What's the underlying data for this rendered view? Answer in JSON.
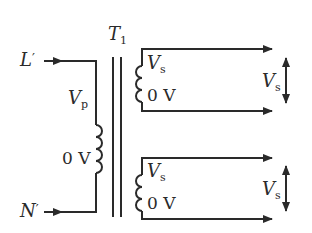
{
  "diagram": {
    "type": "transformer-schematic",
    "transformer": {
      "label": "T",
      "label_sub": "1"
    },
    "primary": {
      "live_input": {
        "label": "L",
        "mark": "′"
      },
      "neutral_input": {
        "label": "N",
        "mark": "′"
      },
      "top_tap": {
        "label": "V",
        "sub": "p"
      },
      "bottom_tap": {
        "label": "0 V"
      }
    },
    "secondaries": [
      {
        "top_tap": {
          "label": "V",
          "sub": "s"
        },
        "bottom_tap": {
          "label": "0 V"
        },
        "output_voltage": {
          "label": "V",
          "sub": "s"
        }
      },
      {
        "top_tap": {
          "label": "V",
          "sub": "s"
        },
        "bottom_tap": {
          "label": "0 V"
        },
        "output_voltage": {
          "label": "V",
          "sub": "s"
        }
      }
    ],
    "colors": {
      "line": "#2a2a2a",
      "background": "#ffffff"
    }
  }
}
